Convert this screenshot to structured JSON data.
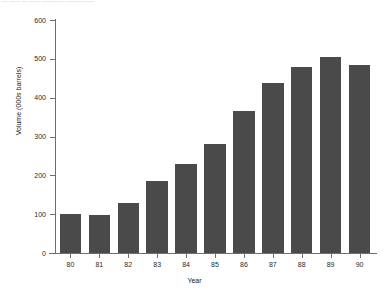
{
  "caption_fragment": "— —— — —— ————  —————",
  "chart_data": {
    "type": "bar",
    "title": "",
    "xlabel": "Year",
    "ylabel": "Volume (000s barrels)",
    "categories": [
      "80",
      "81",
      "82",
      "83",
      "84",
      "85",
      "86",
      "87",
      "88",
      "89",
      "90"
    ],
    "values": [
      100,
      97,
      128,
      185,
      228,
      282,
      365,
      438,
      478,
      505,
      485
    ],
    "ylim": [
      0,
      600
    ],
    "y_ticks": [
      0,
      100,
      200,
      300,
      400,
      500,
      600
    ],
    "y_tick_labels": [
      "0",
      "100",
      "200",
      "300",
      "400",
      "500",
      "600"
    ],
    "grid": false,
    "legend": false,
    "bar_color": "#4a4a4a",
    "axis_color": "#6e6e6e",
    "background": "#ffffff"
  }
}
